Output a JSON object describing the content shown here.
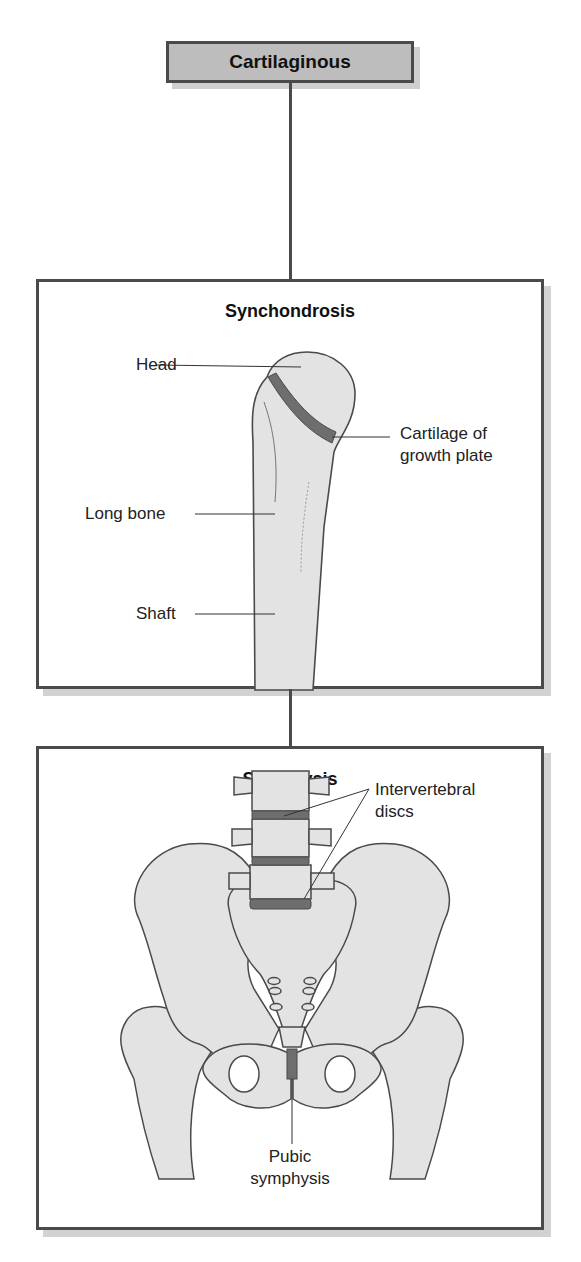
{
  "header": {
    "title": "Cartilaginous"
  },
  "synchondrosis": {
    "title": "Synchondrosis",
    "labels": {
      "head": "Head",
      "cartilage_line1": "Cartilage of",
      "cartilage_line2": "growth plate",
      "long_bone": "Long bone",
      "shaft": "Shaft"
    }
  },
  "symphysis": {
    "title": "Symphysis",
    "labels": {
      "intervertebral_line1": "Intervertebral",
      "intervertebral_line2": "discs",
      "pubic_line1": "Pubic",
      "pubic_line2": "symphysis"
    }
  },
  "colors": {
    "bone_fill": "#e3e3e3",
    "cartilage_fill": "#6e6e6e",
    "outline": "#4a4a4a",
    "header_fill": "#bdbdbd"
  }
}
